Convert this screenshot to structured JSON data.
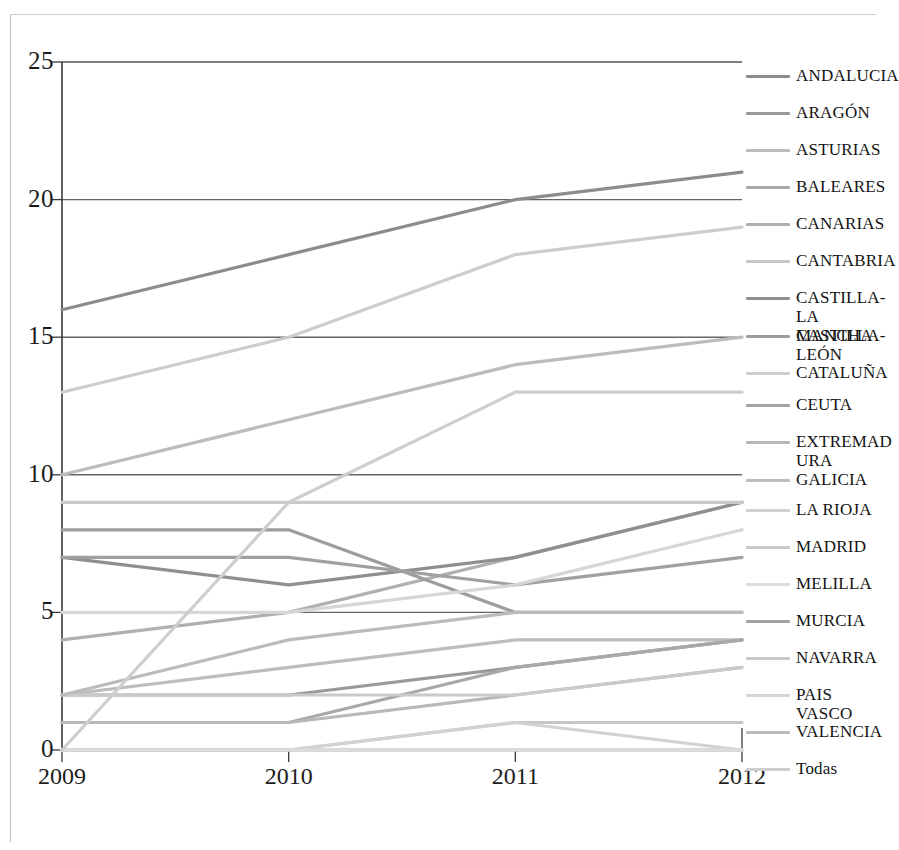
{
  "chart_data": {
    "type": "line",
    "title": "",
    "subtitle": "",
    "xlabel": "",
    "ylabel": "",
    "x": [
      "2009",
      "2010",
      "2011",
      "2012"
    ],
    "categories": [
      "2009",
      "2010",
      "2011",
      "2012"
    ],
    "ylim": [
      0,
      25
    ],
    "yticks": [
      0,
      5,
      10,
      15,
      20,
      25
    ],
    "ytick_labels": [
      "0",
      "5",
      "10",
      "15",
      "20",
      "25"
    ],
    "xtick_labels": [
      "2009",
      "2010",
      "2011",
      "2012"
    ],
    "grid": true,
    "grid_axis": "y",
    "legend_position": "right",
    "series": [
      {
        "name": "ANDALUCIA",
        "values": [
          16,
          18,
          20,
          21
        ],
        "color": "#8c8c8c"
      },
      {
        "name": "ARAGÓN",
        "values": [
          2,
          2,
          3,
          4
        ],
        "color": "#9a9a9a"
      },
      {
        "name": "ASTURIAS",
        "values": [
          2,
          3,
          4,
          4
        ],
        "color": "#bdbdbd"
      },
      {
        "name": "BALEARES",
        "values": [
          1,
          1,
          3,
          4
        ],
        "color": "#a8a8a8"
      },
      {
        "name": "CANARIAS",
        "values": [
          4,
          5,
          7,
          9
        ],
        "color": "#b0b0b0"
      },
      {
        "name": "CANTABRIA",
        "values": [
          0,
          0,
          1,
          1
        ],
        "color": "#c6c6c6"
      },
      {
        "name": "CASTILLA-\nLA MANCHA",
        "values": [
          7,
          6,
          7,
          9
        ],
        "color": "#8f8f8f"
      },
      {
        "name": "CASTILLA-\nLEÓN",
        "values": [
          8,
          8,
          5,
          5
        ],
        "color": "#9d9d9d"
      },
      {
        "name": "CATALUÑA",
        "values": [
          13,
          15,
          18,
          19
        ],
        "color": "#cdcdcd"
      },
      {
        "name": "CEUTA",
        "values": [
          0,
          0,
          0,
          0
        ],
        "color": "#a5a5a5"
      },
      {
        "name": "EXTREMAD\nURA",
        "values": [
          1,
          1,
          2,
          3
        ],
        "color": "#b8b8b8"
      },
      {
        "name": "GALICIA",
        "values": [
          10,
          12,
          14,
          15
        ],
        "color": "#bcbcbc"
      },
      {
        "name": "LA RIOJA",
        "values": [
          0,
          0,
          1,
          0
        ],
        "color": "#d2d2d2"
      },
      {
        "name": "MADRID",
        "values": [
          9,
          9,
          9,
          9
        ],
        "color": "#c9c9c9"
      },
      {
        "name": "MELILLA",
        "values": [
          0,
          0,
          0,
          0
        ],
        "color": "#dcdcdc"
      },
      {
        "name": "MURCIA",
        "values": [
          7,
          7,
          6,
          7
        ],
        "color": "#a0a0a0"
      },
      {
        "name": "NAVARRA",
        "values": [
          2,
          2,
          2,
          3
        ],
        "color": "#cacaca"
      },
      {
        "name": "PAIS VASCO",
        "values": [
          5,
          5,
          6,
          8
        ],
        "color": "#d6d6d6"
      },
      {
        "name": "VALENCIA",
        "values": [
          2,
          4,
          5,
          5
        ],
        "color": "#bbbbbb"
      },
      {
        "name": "Todas",
        "values": [
          0,
          9,
          13,
          13
        ],
        "color": "#cecece"
      }
    ]
  },
  "axes": {
    "y_tick_labels": [
      "25",
      "20",
      "15",
      "10",
      "5",
      "0"
    ],
    "x_tick_labels": [
      "2009",
      "2010",
      "2011",
      "2012"
    ]
  },
  "legend": {
    "items": [
      {
        "label": "ANDALUCIA"
      },
      {
        "label": "ARAGÓN"
      },
      {
        "label": "ASTURIAS"
      },
      {
        "label": "BALEARES"
      },
      {
        "label": "CANARIAS"
      },
      {
        "label": "CANTABRIA"
      },
      {
        "label": "CASTILLA-\nLA MANCHA"
      },
      {
        "label": "CASTILLA-\nLEÓN"
      },
      {
        "label": "CATALUÑA"
      },
      {
        "label": "CEUTA"
      },
      {
        "label": "EXTREMAD\nURA"
      },
      {
        "label": "GALICIA"
      },
      {
        "label": "LA RIOJA"
      },
      {
        "label": "MADRID"
      },
      {
        "label": "MELILLA"
      },
      {
        "label": "MURCIA"
      },
      {
        "label": "NAVARRA"
      },
      {
        "label": "PAIS VASCO"
      },
      {
        "label": "VALENCIA"
      },
      {
        "label": "Todas"
      }
    ]
  },
  "style": {
    "axis_color": "#3a3a3a",
    "grid_color": "#4a4a4a",
    "text_color": "#1c1c1c",
    "background": "#ffffff"
  }
}
